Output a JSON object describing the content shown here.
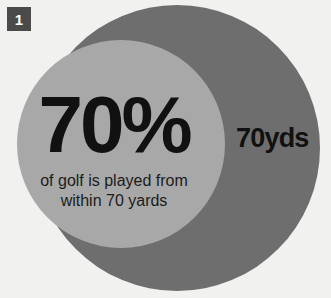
{
  "badge": {
    "number": "1"
  },
  "stat": {
    "value": "70%",
    "caption_line1": "of golf is played from",
    "caption_line2": "within 70 yards"
  },
  "ring_label": {
    "text": "70yds"
  },
  "colors": {
    "background": "#f1f1f0",
    "outer_circle": "#6e6e6e",
    "inner_circle": "#a8a8a8",
    "badge_background": "#4a4a4a",
    "badge_text": "#ffffff",
    "text_dark": "#111111"
  },
  "chart_data": {
    "type": "pie",
    "title": "70% of golf is played from within 70 yards",
    "categories": [
      "Within 70 yards",
      "Beyond 70 yards"
    ],
    "values": [
      70,
      30
    ],
    "value_labels": [
      "70%",
      ""
    ],
    "units": "percent",
    "annotations": [
      "70%",
      "of golf is played from within 70 yards",
      "70yds"
    ],
    "legend": [
      "70yds"
    ],
    "legend_position": "inline-right",
    "grid": false
  }
}
